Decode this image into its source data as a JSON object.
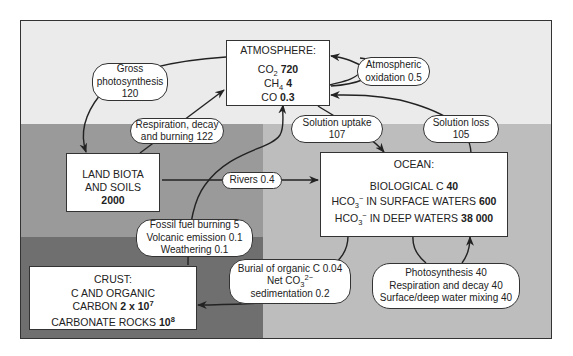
{
  "diagram": {
    "colors": {
      "top_region": "#ebebeb",
      "land_region": "#9a9a9a",
      "crust_region": "#6f6f6f",
      "ocean_region": "#bdbdbd",
      "box_fill": "#ffffff",
      "stroke": "#333333"
    },
    "reservoirs": {
      "atmosphere": {
        "title": "ATMOSPHERE:",
        "co2_label": "CO",
        "co2_sub": "2",
        "co2_value": "720",
        "ch4_label": "CH",
        "ch4_sub": "4",
        "ch4_value": "4",
        "co_label": "CO",
        "co_value": "0.3"
      },
      "land": {
        "line1": "LAND BIOTA",
        "line2": "AND SOILS",
        "value": "2000"
      },
      "ocean": {
        "title": "OCEAN:",
        "bio_label": "BIOLOGICAL C",
        "bio_value": "40",
        "surface_label_a": "HCO",
        "surface_sub": "3",
        "surface_sup": "−",
        "surface_label_b": " IN SURFACE WATERS",
        "surface_value": "600",
        "deep_label_a": "HCO",
        "deep_sub": "3",
        "deep_sup": "−",
        "deep_label_b": " IN DEEP WATERS",
        "deep_value": "38 000"
      },
      "crust": {
        "title": "CRUST:",
        "line1": "C AND ORGANIC",
        "carbon_label": "CARBON",
        "carbon_value": "2 x 10",
        "carbon_exp": "7",
        "rocks_label": "CARBONATE ROCKS",
        "rocks_value": "10",
        "rocks_exp": "8"
      }
    },
    "fluxes": {
      "gross_photosynthesis": {
        "line1": "Gross",
        "line2": "photosynthesis",
        "line3": "120"
      },
      "respiration": {
        "line1": "Respiration, decay",
        "line2": "and burning 122"
      },
      "atmospheric_oxidation": {
        "line1": "Atmospheric",
        "line2": "oxidation 0.5"
      },
      "solution_uptake": {
        "line1": "Solution uptake",
        "line2": "107"
      },
      "solution_loss": {
        "line1": "Solution loss",
        "line2": "105"
      },
      "rivers": {
        "label": "Rivers 0.4"
      },
      "fossil": {
        "line1": "Fossil fuel burning 5",
        "line2": "Volcanic emission 0.1",
        "line3": "Weathering  0.1"
      },
      "burial": {
        "line1": "Burial of organic C 0.04",
        "line2a": "Net  CO",
        "line2_sub": "3",
        "line2_sup": "2−",
        "line3": "sedimentation 0.2"
      },
      "ocean_internal": {
        "line1": "Photosynthesis 40",
        "line2": "Respiration and decay 40",
        "line3": "Surface/deep water mixing 40"
      }
    }
  }
}
